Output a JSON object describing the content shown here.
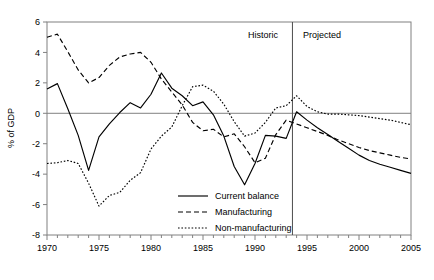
{
  "chart_data": {
    "type": "line",
    "title": "",
    "xlabel": "",
    "ylabel": "% of GDP",
    "xlim": [
      1970,
      2005
    ],
    "ylim": [
      -8,
      6
    ],
    "ytick_values": [
      6,
      4,
      2,
      0,
      -2,
      -4,
      -6,
      -8
    ],
    "ytick_labels": [
      "6",
      "4",
      "2",
      "0",
      "-2",
      "-4",
      "-6",
      "-8"
    ],
    "xtick_values": [
      1970,
      1975,
      1980,
      1985,
      1990,
      1995,
      2000,
      2005
    ],
    "xtick_labels": [
      "1970",
      "1975",
      "1980",
      "1985",
      "1990",
      "1995",
      "2000",
      "2005"
    ],
    "minor_xticks_every": 1,
    "grid": false,
    "zero_line": true,
    "legend_position": "lower-center-right",
    "x": [
      1970,
      1971,
      1972,
      1973,
      1974,
      1975,
      1976,
      1977,
      1978,
      1979,
      1980,
      1981,
      1982,
      1983,
      1984,
      1985,
      1986,
      1987,
      1988,
      1989,
      1990,
      1991,
      1992,
      1993,
      1994,
      1995,
      1996,
      1997,
      1998,
      1999,
      2000,
      2001,
      2002,
      2003,
      2004,
      2005
    ],
    "series": [
      {
        "name": "Current balance",
        "style": "solid",
        "values": [
          1.6,
          1.95,
          0.3,
          -1.45,
          -3.75,
          -1.55,
          -0.7,
          0.05,
          0.7,
          0.35,
          1.25,
          2.65,
          1.65,
          1.15,
          0.5,
          0.75,
          -0.1,
          -1.5,
          -3.5,
          -4.7,
          -3.3,
          -1.45,
          -1.5,
          -1.65,
          0.1,
          -0.45,
          -0.95,
          -1.4,
          -1.85,
          -2.3,
          -2.75,
          -3.1,
          -3.35,
          -3.55,
          -3.75,
          -3.95
        ]
      },
      {
        "name": "Manufacturing",
        "style": "dashed",
        "values": [
          5.0,
          5.2,
          4.05,
          2.85,
          2.0,
          2.35,
          3.15,
          3.7,
          3.9,
          4.0,
          3.35,
          2.25,
          1.4,
          0.55,
          -0.6,
          -1.15,
          -1.05,
          -1.55,
          -1.35,
          -2.2,
          -3.25,
          -2.95,
          -1.4,
          -0.45,
          -0.7,
          -0.95,
          -1.2,
          -1.45,
          -1.75,
          -2.0,
          -2.25,
          -2.45,
          -2.6,
          -2.75,
          -2.9,
          -3.0
        ]
      },
      {
        "name": "Non-manufacturing",
        "style": "dotted",
        "values": [
          -3.3,
          -3.25,
          -3.1,
          -3.3,
          -4.6,
          -6.1,
          -5.4,
          -5.2,
          -4.4,
          -3.9,
          -2.35,
          -1.5,
          -0.9,
          0.5,
          1.75,
          1.85,
          1.45,
          0.6,
          -0.55,
          -1.5,
          -1.3,
          -0.6,
          0.35,
          0.5,
          1.15,
          0.45,
          0.1,
          -0.05,
          -0.05,
          -0.1,
          -0.15,
          -0.25,
          -0.35,
          -0.45,
          -0.6,
          -0.75
        ]
      }
    ],
    "annotations": [
      {
        "id": "divider",
        "type": "vline",
        "x": 1993.6,
        "label": ""
      },
      {
        "id": "historic-label",
        "type": "text",
        "text": "Historic",
        "x": 1989.5,
        "y": 5.1
      },
      {
        "id": "projected-label",
        "type": "text",
        "text": "Projected",
        "x": 1995.0,
        "y": 5.1
      }
    ]
  },
  "legend": {
    "entries": [
      {
        "label": "Current balance",
        "style": "solid"
      },
      {
        "label": "Manufacturing",
        "style": "dashed"
      },
      {
        "label": "Non-manufacturing",
        "style": "dotted"
      }
    ]
  },
  "regions": {
    "historic": "Historic",
    "projected": "Projected"
  },
  "axis": {
    "y_title": "% of GDP"
  }
}
